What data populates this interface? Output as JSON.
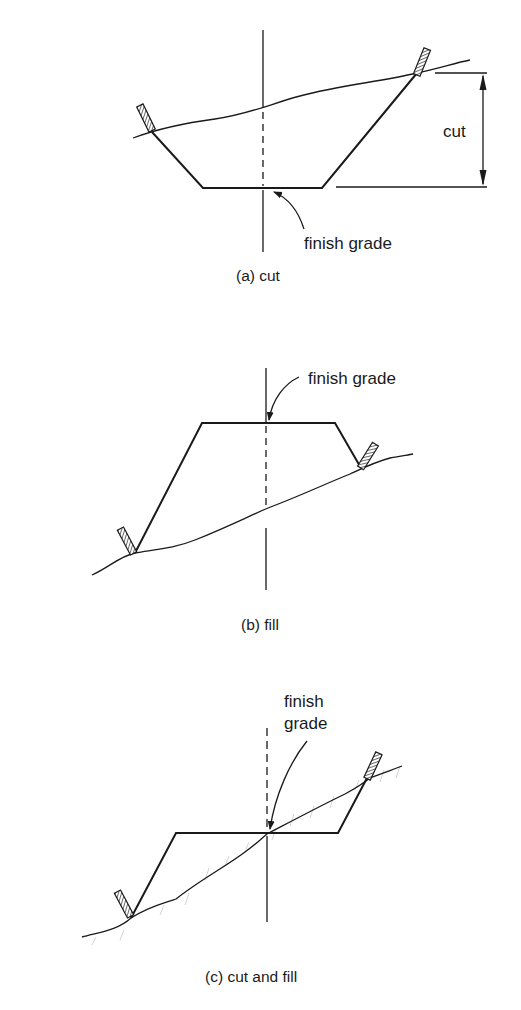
{
  "figure": {
    "panels": [
      {
        "id": "a",
        "caption": "(a) cut",
        "labels": {
          "finish_grade": "finish grade",
          "dimension": "cut"
        }
      },
      {
        "id": "b",
        "caption": "(b) fill",
        "labels": {
          "finish_grade": "finish grade"
        }
      },
      {
        "id": "c",
        "caption": "(c) cut and fill",
        "labels": {
          "finish_grade_line1": "finish",
          "finish_grade_line2": "grade"
        }
      }
    ],
    "colors": {
      "line": "#1a1a1a",
      "background": "#ffffff",
      "ground_hatch": "#c8c8c8"
    }
  }
}
